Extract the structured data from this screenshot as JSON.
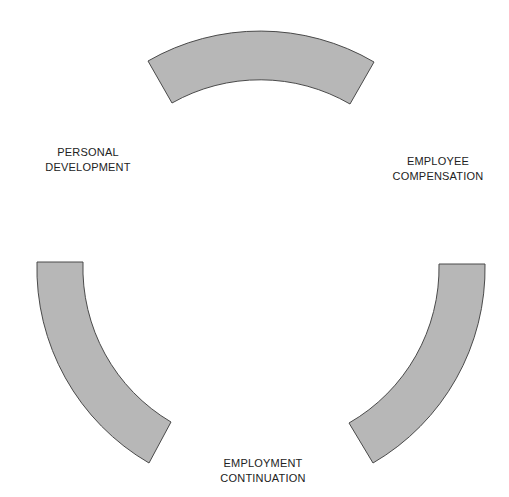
{
  "diagram": {
    "type": "cycle",
    "colors": {
      "segment_fill": "#b7b7b7",
      "segment_stroke": "#4a4a4a",
      "text": "#222222",
      "background": "#ffffff"
    },
    "segments": [
      {
        "id": "top",
        "position": "top"
      },
      {
        "id": "right",
        "position": "bottom-right"
      },
      {
        "id": "left",
        "position": "bottom-left"
      }
    ],
    "labels": [
      {
        "id": "personal-development",
        "lines": [
          "PERSONAL",
          "DEVELOPMENT"
        ]
      },
      {
        "id": "employee-compensation",
        "lines": [
          "EMPLOYEE",
          "COMPENSATION"
        ]
      },
      {
        "id": "employment-continuation",
        "lines": [
          "EMPLOYMENT",
          "CONTINUATION"
        ]
      }
    ]
  }
}
